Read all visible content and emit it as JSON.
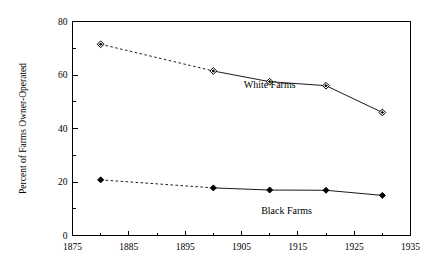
{
  "chart_data": {
    "type": "line",
    "title": "",
    "subtitle": "",
    "xlabel": "",
    "ylabel": "Percent of Farms Owner-Operated",
    "xlim": [
      1875,
      1935
    ],
    "ylim": [
      0,
      80
    ],
    "grid": false,
    "legend_position": "inline-annotation",
    "x_major_ticks": [
      1875,
      1885,
      1895,
      1905,
      1915,
      1925,
      1935
    ],
    "x_major_tick_labels": [
      "1875",
      "1885",
      "1895",
      "1905",
      "1915",
      "1925",
      "1935"
    ],
    "x_minor_ticks": [
      1880,
      1890,
      1900,
      1910,
      1920,
      1930
    ],
    "y_major_ticks": [
      0,
      20,
      40,
      60,
      80
    ],
    "y_major_tick_labels": [
      "0",
      "20",
      "40",
      "60",
      "80"
    ],
    "y_minor_ticks": [
      10,
      30,
      50,
      70
    ],
    "x": [
      1880,
      1900,
      1910,
      1920,
      1930
    ],
    "series": [
      {
        "name": "White Farms",
        "label": "White Farms",
        "marker": "open-diamond",
        "first_segment_style": "dashed",
        "label_x": 1910,
        "label_y": 55,
        "values": [
          71.5,
          61.5,
          57.5,
          56.0,
          46.0
        ]
      },
      {
        "name": "Black Farms",
        "label": "Black Farms",
        "marker": "filled-diamond",
        "first_segment_style": "dashed",
        "label_x": 1913,
        "label_y": 8,
        "values": [
          20.8,
          17.8,
          17.0,
          16.9,
          15.0
        ]
      }
    ],
    "colors": {
      "line": "#000000",
      "axis": "#000000",
      "background": "#ffffff"
    }
  }
}
